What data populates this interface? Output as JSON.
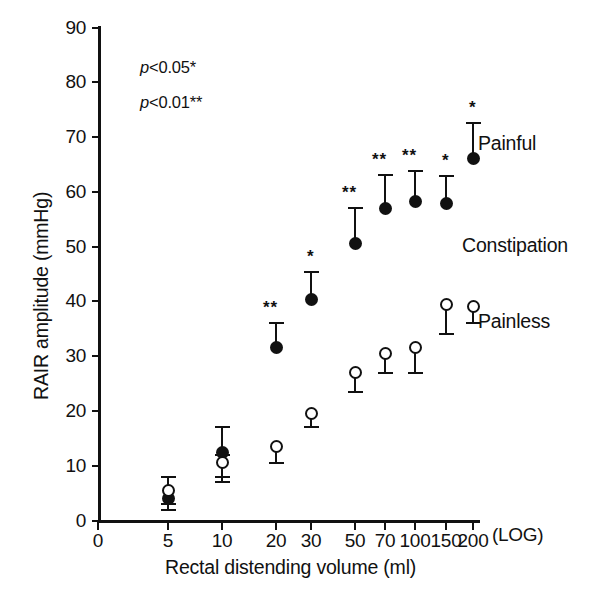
{
  "chart_data": {
    "type": "scatter",
    "title": "",
    "xlabel": "Rectal distending volume (ml)",
    "ylabel": "RAIR amplitude (mmHg)",
    "x_scale": "log",
    "x_scale_note": "(LOG)",
    "x_ticks": [
      "0",
      "5",
      "10",
      "20",
      "30",
      "50",
      "70",
      "100",
      "150",
      "200"
    ],
    "y_ticks": [
      "0",
      "10",
      "20",
      "30",
      "40",
      "50",
      "60",
      "70",
      "80",
      "90"
    ],
    "ylim": [
      0,
      90
    ],
    "grid": false,
    "legend_position": "right",
    "group_label": "Constipation",
    "annotations": [
      "p<0.05*",
      "p<0.01**"
    ],
    "categories": [
      5,
      10,
      20,
      30,
      50,
      70,
      100,
      150,
      200
    ],
    "series": [
      {
        "name": "Painful",
        "marker": "filled-circle",
        "values": [
          4.0,
          12.5,
          31.5,
          40.3,
          50.5,
          57.0,
          58.3,
          57.8,
          66.0
        ],
        "err_low": [
          2.0,
          4.5,
          0.0,
          0.0,
          0.0,
          0.0,
          0.0,
          0.0,
          0.0
        ],
        "err_high": [
          4.0,
          4.5,
          4.5,
          5.0,
          6.5,
          6.0,
          5.5,
          5.0,
          6.5
        ],
        "significance": [
          "",
          "",
          "**",
          "*",
          "**",
          "**",
          "**",
          "*",
          "*"
        ]
      },
      {
        "name": "Painless",
        "marker": "open-circle",
        "values": [
          5.5,
          10.5,
          13.5,
          19.5,
          27.0,
          30.5,
          31.5,
          39.5,
          39.0
        ],
        "err_low": [
          2.5,
          3.5,
          3.0,
          2.5,
          3.5,
          3.5,
          4.5,
          5.5,
          3.0
        ],
        "err_high": [
          2.5,
          1.5,
          0.0,
          0.0,
          0.0,
          0.0,
          0.0,
          0.0,
          0.0
        ],
        "significance": [
          "",
          "",
          "",
          "",
          "",
          "",
          "",
          "",
          ""
        ]
      }
    ]
  },
  "labels": {
    "painful": "Painful",
    "constipation": "Constipation",
    "painless": "Painless",
    "log": "(LOG)",
    "p05": "p<0.05*",
    "p01": "p<0.01**",
    "xaxis": "Rectal distending volume (ml)",
    "yaxis": "RAIR amplitude (mmHg)"
  }
}
